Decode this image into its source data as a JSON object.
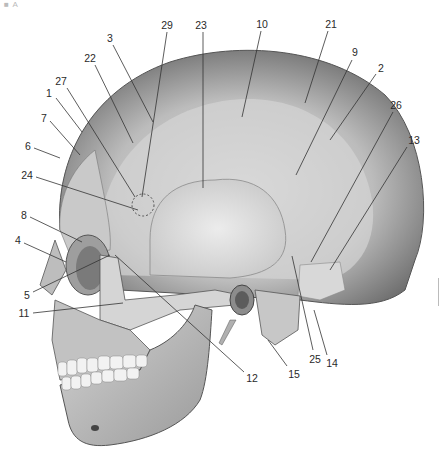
{
  "figure": {
    "panel_mark": "■ A",
    "labels": [
      {
        "id": "1",
        "text": "1",
        "x": 49,
        "y": 93
      },
      {
        "id": "2",
        "text": "2",
        "x": 381,
        "y": 68
      },
      {
        "id": "3",
        "text": "3",
        "x": 110,
        "y": 38
      },
      {
        "id": "4",
        "text": "4",
        "x": 18,
        "y": 240
      },
      {
        "id": "5",
        "text": "5",
        "x": 27,
        "y": 295
      },
      {
        "id": "6",
        "text": "6",
        "x": 28,
        "y": 146
      },
      {
        "id": "7",
        "text": "7",
        "x": 44,
        "y": 118
      },
      {
        "id": "8",
        "text": "8",
        "x": 24,
        "y": 215
      },
      {
        "id": "9",
        "text": "9",
        "x": 355,
        "y": 52
      },
      {
        "id": "10",
        "text": "10",
        "x": 262,
        "y": 24
      },
      {
        "id": "11",
        "text": "11",
        "x": 24,
        "y": 313
      },
      {
        "id": "12",
        "text": "12",
        "x": 252,
        "y": 378
      },
      {
        "id": "13",
        "text": "13",
        "x": 414,
        "y": 140
      },
      {
        "id": "14",
        "text": "14",
        "x": 332,
        "y": 363
      },
      {
        "id": "15",
        "text": "15",
        "x": 294,
        "y": 374
      },
      {
        "id": "21",
        "text": "21",
        "x": 331,
        "y": 24
      },
      {
        "id": "22",
        "text": "22",
        "x": 90,
        "y": 58
      },
      {
        "id": "23",
        "text": "23",
        "x": 201,
        "y": 25
      },
      {
        "id": "24",
        "text": "24",
        "x": 27,
        "y": 175
      },
      {
        "id": "25",
        "text": "25",
        "x": 315,
        "y": 359
      },
      {
        "id": "26",
        "text": "26",
        "x": 396,
        "y": 105
      },
      {
        "id": "27",
        "text": "27",
        "x": 61,
        "y": 81
      },
      {
        "id": "29",
        "text": "29",
        "x": 167,
        "y": 25
      }
    ]
  }
}
